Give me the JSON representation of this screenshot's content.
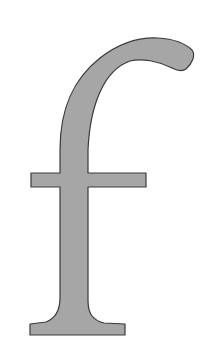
{
  "glyph": {
    "character": "f",
    "fill_color": "#a6a6a6",
    "stroke_color": "#3a3a3a",
    "background_color": "#ffffff"
  }
}
